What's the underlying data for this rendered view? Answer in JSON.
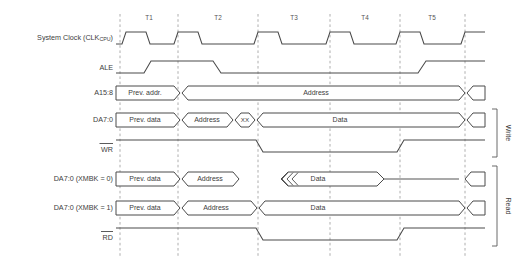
{
  "diagram": {
    "type": "timing-diagram",
    "cycle_labels": [
      "T1",
      "T2",
      "T3",
      "T4",
      "T5"
    ],
    "gridline_x": [
      120,
      178,
      258,
      330,
      400,
      465
    ],
    "signals": [
      {
        "id": "clk",
        "label_main": "System Clock (CLK",
        "label_sub": "CPU",
        "label_tail": ")",
        "kind": "clock"
      },
      {
        "id": "ale",
        "label_main": "ALE",
        "kind": "level"
      },
      {
        "id": "a158",
        "label_main": "A15:8",
        "kind": "bus",
        "segments": [
          {
            "text": "Prev. addr."
          },
          {
            "text": "Address"
          }
        ]
      },
      {
        "id": "da70_write",
        "label_main": "DA7:0",
        "kind": "bus",
        "segments": [
          {
            "text": "Prev. data"
          },
          {
            "text": "Address"
          },
          {
            "text": "XX"
          },
          {
            "text": "Data"
          }
        ]
      },
      {
        "id": "wr",
        "label_main": "WR",
        "overline": true,
        "kind": "strobe"
      },
      {
        "id": "da70_xmbk0",
        "label_main": "DA7:0 (XMBK = 0)",
        "kind": "bus",
        "segments": [
          {
            "text": "Prev. data"
          },
          {
            "text": "Address"
          },
          {
            "text": "Data"
          }
        ]
      },
      {
        "id": "da70_xmbk1",
        "label_main": "DA7:0 (XMBK = 1)",
        "kind": "bus",
        "segments": [
          {
            "text": "Prev. data"
          },
          {
            "text": "Address"
          },
          {
            "text": "Data"
          }
        ]
      },
      {
        "id": "rd",
        "label_main": "RD",
        "overline": true,
        "kind": "strobe"
      }
    ],
    "groups": [
      {
        "label": "Write"
      },
      {
        "label": "Read"
      }
    ],
    "colors": {
      "wave": "#4a4a4a",
      "grid": "#9a9a9a",
      "text": "#3d3d3d",
      "background": "#ffffff"
    }
  }
}
